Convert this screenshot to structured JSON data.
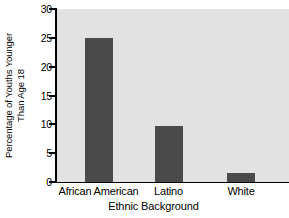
{
  "chart_data": {
    "type": "bar",
    "title": "",
    "xlabel": "Ethnic Background",
    "ylabel": "Percentage of Youths Younger Than Age 18",
    "ylabel_line1": "Percentage of Youths Younger",
    "ylabel_line2": "Than Age 18",
    "categories": [
      "African American",
      "Latino",
      "White"
    ],
    "values": [
      25,
      9.8,
      1.6
    ],
    "ylim": [
      0,
      30
    ],
    "yticks": [
      0,
      5,
      10,
      15,
      20,
      25,
      30
    ],
    "ytick_labels": [
      "0",
      "5",
      "10",
      "15",
      "20",
      "25",
      "30"
    ],
    "grid": false,
    "legend": "none",
    "bar_color": "#4a4a4a",
    "plot_background": "#e2e2e2",
    "page_background": "#ffffff",
    "axis_color": "#000000"
  }
}
